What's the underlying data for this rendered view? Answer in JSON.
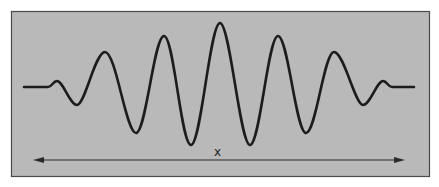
{
  "diagram": {
    "type": "wave-packet",
    "colors": {
      "panel_background": "#b9b9b9",
      "panel_border": "#4a4a4a",
      "wave_stroke": "#1c1c1c",
      "arrow_stroke": "#2a2a2a",
      "page_background": "#ffffff"
    },
    "arrow": {
      "label": "x",
      "direction": "double-headed horizontal"
    }
  }
}
